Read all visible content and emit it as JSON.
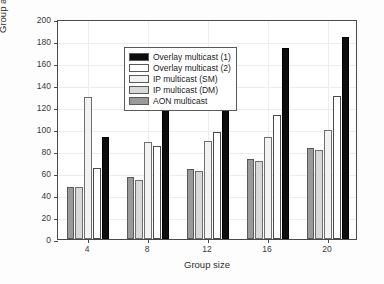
{
  "chart_data": {
    "type": "bar",
    "title": "",
    "xlabel": "Group size",
    "ylabel": "Group average delay (GAD) (ms)",
    "categories": [
      "4",
      "8",
      "12",
      "16",
      "20"
    ],
    "ylim": [
      0,
      200
    ],
    "yticks": [
      0,
      20,
      40,
      60,
      80,
      100,
      120,
      140,
      160,
      180,
      200
    ],
    "ytick_labels": [
      "0",
      "20",
      "40",
      "60",
      "80",
      "100",
      "120",
      "140",
      "160",
      "180",
      "200"
    ],
    "grid": true,
    "legend_position": "upper left",
    "series": [
      {
        "name": "AON multicast",
        "key": "aon",
        "color": "#9a9a9a",
        "values": [
          47,
          56,
          64,
          73,
          83
        ]
      },
      {
        "name": "IP multicast (DM)",
        "key": "ipdm",
        "color": "#d8d8d8",
        "values": [
          47,
          54,
          62,
          71,
          81
        ]
      },
      {
        "name": "IP multicast (SM)",
        "key": "ipsm",
        "color": "#f2f2f2",
        "values": [
          129,
          88,
          89,
          93,
          99
        ]
      },
      {
        "name": "Overlay multicast (2)",
        "key": "overlay2",
        "color": "#ffffff",
        "values": [
          65,
          85,
          97,
          113,
          130
        ]
      },
      {
        "name": "Overlay multicast (1)",
        "key": "overlay1",
        "color": "#0d0d0d",
        "values": [
          93,
          129,
          157,
          174,
          184
        ]
      }
    ],
    "legend_order": [
      "Overlay multicast (1)",
      "Overlay multicast (2)",
      "IP multicast (SM)",
      "IP multicast (DM)",
      "AON multicast"
    ]
  },
  "legend": {
    "items": [
      {
        "label": "Overlay multicast (1)",
        "swatch_class": "s-overlay1"
      },
      {
        "label": "Overlay multicast (2)",
        "swatch_class": "s-overlay2"
      },
      {
        "label": "IP multicast (SM)",
        "swatch_class": "s-ipsm"
      },
      {
        "label": "IP multicast (DM)",
        "swatch_class": "s-ipdm"
      },
      {
        "label": "AON multicast",
        "swatch_class": "s-aon"
      }
    ]
  },
  "axes": {
    "y_title": "Group average delay (GAD) (ms)",
    "x_title": "Group size"
  }
}
